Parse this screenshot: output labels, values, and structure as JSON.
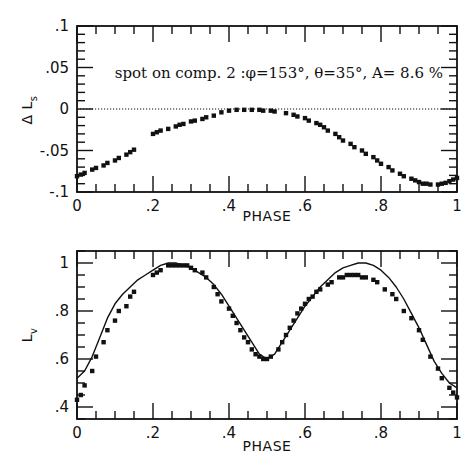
{
  "chart_data": [
    {
      "type": "scatter",
      "title": "",
      "annotation": "spot on comp. 2 :φ=153°, θ=35°, A= 8.6 %",
      "xlabel": "PHASE",
      "ylabel": "Δ L_s",
      "xlim": [
        0,
        1
      ],
      "ylim": [
        -0.1,
        0.1
      ],
      "xticks": [
        "0",
        ".2",
        ".4",
        ".6",
        ".8",
        "1"
      ],
      "yticks": [
        ".1",
        ".05",
        "0",
        "-.05",
        "-.1"
      ],
      "grid": false,
      "reference_line": {
        "y": 0,
        "style": "dotted"
      },
      "series": [
        {
          "name": "Delta L_s residuals",
          "style": "points",
          "x": [
            0.0,
            0.01,
            0.02,
            0.04,
            0.05,
            0.07,
            0.08,
            0.1,
            0.11,
            0.13,
            0.14,
            0.15,
            0.2,
            0.21,
            0.22,
            0.24,
            0.26,
            0.27,
            0.28,
            0.3,
            0.31,
            0.33,
            0.34,
            0.36,
            0.38,
            0.4,
            0.42,
            0.44,
            0.46,
            0.48,
            0.49,
            0.51,
            0.52,
            0.55,
            0.57,
            0.58,
            0.6,
            0.61,
            0.63,
            0.64,
            0.65,
            0.66,
            0.68,
            0.69,
            0.7,
            0.72,
            0.73,
            0.75,
            0.76,
            0.78,
            0.79,
            0.8,
            0.82,
            0.83,
            0.85,
            0.86,
            0.88,
            0.89,
            0.9,
            0.91,
            0.92,
            0.93,
            0.95,
            0.96,
            0.97,
            0.98,
            0.99,
            1.0
          ],
          "y": [
            -0.081,
            -0.079,
            -0.077,
            -0.073,
            -0.071,
            -0.068,
            -0.065,
            -0.062,
            -0.059,
            -0.055,
            -0.052,
            -0.049,
            -0.03,
            -0.028,
            -0.026,
            -0.024,
            -0.021,
            -0.019,
            -0.018,
            -0.015,
            -0.014,
            -0.012,
            -0.01,
            -0.008,
            -0.004,
            -0.002,
            -0.001,
            -0.001,
            -0.001,
            -0.001,
            -0.002,
            -0.002,
            -0.003,
            -0.005,
            -0.007,
            -0.009,
            -0.011,
            -0.014,
            -0.017,
            -0.019,
            -0.022,
            -0.026,
            -0.03,
            -0.034,
            -0.038,
            -0.042,
            -0.046,
            -0.05,
            -0.054,
            -0.058,
            -0.062,
            -0.066,
            -0.07,
            -0.074,
            -0.078,
            -0.081,
            -0.084,
            -0.086,
            -0.088,
            -0.09,
            -0.09,
            -0.091,
            -0.091,
            -0.09,
            -0.089,
            -0.087,
            -0.085,
            -0.083
          ]
        }
      ]
    },
    {
      "type": "line",
      "title": "",
      "xlabel": "PHASE",
      "ylabel": "L_v",
      "xlim": [
        0,
        1
      ],
      "ylim": [
        0.35,
        1.05
      ],
      "xticks": [
        "0",
        ".2",
        ".4",
        ".6",
        ".8",
        "1"
      ],
      "yticks": [
        "1",
        ".8",
        ".6",
        ".4"
      ],
      "grid": false,
      "series": [
        {
          "name": "observed",
          "style": "points",
          "x": [
            0.0,
            0.01,
            0.02,
            0.04,
            0.05,
            0.07,
            0.08,
            0.1,
            0.11,
            0.13,
            0.14,
            0.15,
            0.2,
            0.21,
            0.22,
            0.24,
            0.25,
            0.26,
            0.27,
            0.28,
            0.29,
            0.3,
            0.31,
            0.33,
            0.34,
            0.36,
            0.37,
            0.38,
            0.4,
            0.41,
            0.42,
            0.43,
            0.44,
            0.45,
            0.46,
            0.47,
            0.48,
            0.49,
            0.5,
            0.51,
            0.53,
            0.54,
            0.55,
            0.56,
            0.57,
            0.58,
            0.59,
            0.6,
            0.61,
            0.62,
            0.63,
            0.64,
            0.66,
            0.67,
            0.69,
            0.7,
            0.71,
            0.72,
            0.73,
            0.74,
            0.75,
            0.76,
            0.78,
            0.79,
            0.81,
            0.83,
            0.84,
            0.86,
            0.88,
            0.9,
            0.91,
            0.93,
            0.95,
            0.96,
            0.98,
            0.99,
            1.0
          ],
          "y": [
            0.43,
            0.45,
            0.49,
            0.55,
            0.61,
            0.67,
            0.72,
            0.76,
            0.8,
            0.82,
            0.86,
            0.88,
            0.95,
            0.96,
            0.97,
            0.99,
            0.99,
            0.99,
            0.99,
            0.99,
            0.99,
            0.98,
            0.97,
            0.96,
            0.94,
            0.9,
            0.87,
            0.84,
            0.81,
            0.78,
            0.75,
            0.72,
            0.69,
            0.67,
            0.64,
            0.62,
            0.61,
            0.6,
            0.6,
            0.61,
            0.64,
            0.67,
            0.7,
            0.73,
            0.76,
            0.79,
            0.81,
            0.83,
            0.85,
            0.86,
            0.88,
            0.89,
            0.91,
            0.92,
            0.94,
            0.94,
            0.95,
            0.95,
            0.95,
            0.95,
            0.94,
            0.94,
            0.93,
            0.92,
            0.89,
            0.87,
            0.85,
            0.8,
            0.77,
            0.72,
            0.68,
            0.61,
            0.56,
            0.52,
            0.48,
            0.46,
            0.44
          ]
        },
        {
          "name": "model",
          "style": "line",
          "x": [
            0.0,
            0.02,
            0.04,
            0.06,
            0.08,
            0.1,
            0.12,
            0.14,
            0.16,
            0.18,
            0.2,
            0.22,
            0.24,
            0.25,
            0.26,
            0.28,
            0.3,
            0.32,
            0.34,
            0.36,
            0.38,
            0.4,
            0.42,
            0.44,
            0.46,
            0.48,
            0.5,
            0.52,
            0.54,
            0.56,
            0.58,
            0.6,
            0.62,
            0.64,
            0.66,
            0.68,
            0.7,
            0.72,
            0.74,
            0.75,
            0.76,
            0.78,
            0.8,
            0.82,
            0.84,
            0.86,
            0.88,
            0.9,
            0.92,
            0.94,
            0.96,
            0.98,
            1.0
          ],
          "y": [
            0.52,
            0.55,
            0.61,
            0.69,
            0.77,
            0.83,
            0.87,
            0.9,
            0.93,
            0.95,
            0.97,
            0.99,
            1.0,
            1.0,
            1.0,
            0.99,
            0.98,
            0.96,
            0.94,
            0.91,
            0.87,
            0.82,
            0.77,
            0.72,
            0.67,
            0.62,
            0.6,
            0.62,
            0.67,
            0.72,
            0.77,
            0.82,
            0.86,
            0.9,
            0.93,
            0.96,
            0.98,
            0.99,
            1.0,
            1.0,
            1.0,
            0.99,
            0.97,
            0.94,
            0.9,
            0.85,
            0.79,
            0.73,
            0.66,
            0.59,
            0.54,
            0.5,
            0.48
          ]
        }
      ]
    }
  ],
  "labels": {
    "top_annotation": "spot on comp. 2 :φ=153°, θ=35°, A= 8.6 %",
    "top_xlabel": "PHASE",
    "top_ylabel_main": "Δ L",
    "top_ylabel_sub": "s",
    "bottom_xlabel": "PHASE",
    "bottom_ylabel_main": "L",
    "bottom_ylabel_sub": "v"
  }
}
